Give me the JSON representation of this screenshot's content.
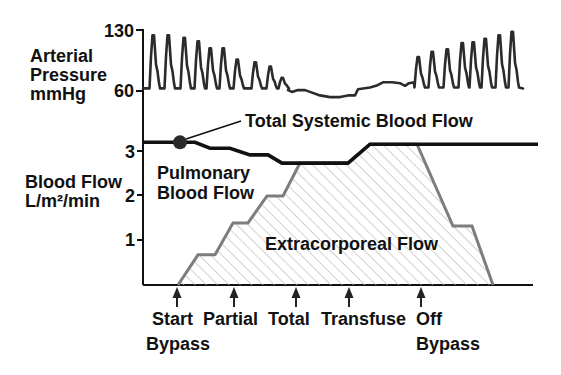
{
  "chart_data": {
    "type": "line",
    "title": "",
    "xlabel": "",
    "panels": [
      {
        "name": "arterial_pressure",
        "ylabel": [
          "Arterial",
          "Pressure",
          "mmHg"
        ],
        "yticks": [
          "130",
          "60"
        ],
        "ylim": [
          60,
          130
        ],
        "series": [
          {
            "name": "Arterial Pressure",
            "unit": "mmHg",
            "color": "#2b2b2b",
            "segments": [
              {
                "type": "flat",
                "points": [
                  [
                    0,
                    63
                  ],
                  [
                    5,
                    63
                  ]
                ]
              },
              {
                "type": "beats",
                "diastolic": 63,
                "beats": [
                  [
                    11,
                    124
                  ],
                  [
                    26,
                    124
                  ],
                  [
                    42,
                    121
                  ],
                  [
                    56,
                    117
                  ],
                  [
                    68,
                    109
                  ],
                  [
                    81,
                    109
                  ],
                  [
                    95,
                    96
                  ],
                  [
                    113,
                    93
                  ],
                  [
                    128,
                    88
                  ],
                  [
                    140,
                    75
                  ]
                ]
              },
              {
                "type": "flat",
                "points": [
                  [
                    145,
                    61
                  ],
                  [
                    149,
                    59
                  ],
                  [
                    155,
                    61
                  ],
                  [
                    162,
                    61
                  ],
                  [
                    167,
                    59
                  ],
                  [
                    177,
                    55
                  ],
                  [
                    187,
                    53
                  ],
                  [
                    197,
                    53
                  ],
                  [
                    205,
                    55
                  ],
                  [
                    212,
                    55
                  ],
                  [
                    215,
                    62
                  ],
                  [
                    227,
                    64
                  ],
                  [
                    233,
                    66
                  ],
                  [
                    240,
                    70
                  ],
                  [
                    249,
                    70
                  ],
                  [
                    257,
                    69
                  ],
                  [
                    262,
                    66
                  ],
                  [
                    266,
                    69
                  ],
                  [
                    271,
                    70
                  ]
                ]
              },
              {
                "type": "beats",
                "diastolic": 64,
                "beats": [
                  [
                    276,
                    99
                  ],
                  [
                    290,
                    105
                  ],
                  [
                    305,
                    108
                  ],
                  [
                    320,
                    115
                  ],
                  [
                    331,
                    116
                  ],
                  [
                    343,
                    120
                  ],
                  [
                    357,
                    124
                  ],
                  [
                    370,
                    128
                  ]
                ]
              },
              {
                "type": "flat",
                "points": [
                  [
                    380,
                    63
                  ]
                ]
              }
            ]
          }
        ]
      },
      {
        "name": "blood_flow",
        "ylabel": [
          "Blood Flow",
          "L/m²/min"
        ],
        "yticks": [
          "3",
          "2",
          "1"
        ],
        "ylim": [
          0,
          3.5
        ],
        "series": [
          {
            "name": "Total Systemic Blood Flow",
            "color": "#111111",
            "points": [
              [
                0,
                3.17
              ],
              [
                52,
                3.17
              ],
              [
                67,
                3.04
              ],
              [
                87,
                3.04
              ],
              [
                107,
                2.89
              ],
              [
                125,
                2.89
              ],
              [
                139,
                2.71
              ],
              [
                205,
                2.71
              ],
              [
                227,
                3.13
              ],
              [
                395,
                3.13
              ]
            ]
          },
          {
            "name": "Extracorporeal Flow",
            "color": "#7d7d7d",
            "fill": "hatched",
            "points": [
              [
                35,
                0
              ],
              [
                55,
                0.67
              ],
              [
                72,
                0.67
              ],
              [
                90,
                1.38
              ],
              [
                105,
                1.38
              ],
              [
                124,
                1.98
              ],
              [
                140,
                1.98
              ],
              [
                157,
                2.71
              ],
              [
                205,
                2.71
              ],
              [
                227,
                3.13
              ],
              [
                274,
                3.13
              ],
              [
                310,
                1.31
              ],
              [
                329,
                1.31
              ],
              [
                350,
                0
              ]
            ]
          }
        ],
        "marker": {
          "t": 37,
          "value": 3.17,
          "label": "Total Systemic Blood Flow"
        },
        "annotations": {
          "total_systemic": "Total Systemic Blood Flow",
          "pulmonary_line1": "Pulmonary",
          "pulmonary_line2": "Blood Flow",
          "extracorporeal": "Extracorporeal Flow"
        }
      }
    ],
    "x_range": [
      0,
      390
    ],
    "events": [
      {
        "t": 34,
        "label": "Start",
        "sublabel": "Bypass"
      },
      {
        "t": 91,
        "label": "Partial",
        "sublabel": ""
      },
      {
        "t": 153,
        "label": "Total",
        "sublabel": ""
      },
      {
        "t": 206,
        "label": "Transfuse",
        "sublabel": ""
      },
      {
        "t": 278,
        "label": "Off",
        "sublabel": "Bypass"
      }
    ]
  }
}
